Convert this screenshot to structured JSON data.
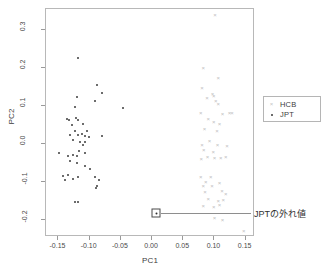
{
  "chart_data": {
    "type": "scatter",
    "title": "",
    "xlabel": "PC1",
    "ylabel": "PC2",
    "xlim": [
      -0.17,
      0.165
    ],
    "ylim": [
      -0.245,
      0.355
    ],
    "xticks": [
      -0.15,
      -0.1,
      -0.05,
      0.0,
      0.05,
      0.1,
      0.15
    ],
    "xticklabels": [
      "-0.15",
      "-0.10",
      "-0.05",
      "0.00",
      "0.05",
      "0.10",
      "0.15"
    ],
    "yticks": [
      -0.2,
      -0.1,
      0.0,
      0.1,
      0.2,
      0.3
    ],
    "yticklabels": [
      "-0.2",
      "-0.1",
      "0.0",
      "0.1",
      "0.2",
      "0.3"
    ],
    "grid": false,
    "legend_position": "right",
    "series": [
      {
        "name": "HCB",
        "marker": "x",
        "color": "#c0c0c0",
        "points": [
          [
            0.101,
            0.338
          ],
          [
            0.082,
            0.2
          ],
          [
            0.106,
            0.173
          ],
          [
            0.08,
            0.148
          ],
          [
            0.097,
            0.131
          ],
          [
            0.088,
            0.12
          ],
          [
            0.099,
            0.126
          ],
          [
            0.102,
            0.112
          ],
          [
            0.106,
            0.104
          ],
          [
            0.078,
            0.081
          ],
          [
            0.113,
            0.079
          ],
          [
            0.124,
            0.082
          ],
          [
            0.128,
            0.081
          ],
          [
            0.09,
            0.065
          ],
          [
            0.099,
            0.058
          ],
          [
            0.108,
            0.052
          ],
          [
            0.084,
            0.038
          ],
          [
            0.104,
            0.035
          ],
          [
            0.092,
            0.007
          ],
          [
            0.08,
            -0.002
          ],
          [
            0.105,
            -0.004
          ],
          [
            0.12,
            -0.005
          ],
          [
            0.083,
            -0.016
          ],
          [
            0.098,
            -0.021
          ],
          [
            0.089,
            -0.034
          ],
          [
            0.079,
            -0.04
          ],
          [
            0.1,
            -0.038
          ],
          [
            0.11,
            -0.037
          ],
          [
            0.118,
            -0.035
          ],
          [
            0.078,
            -0.086
          ],
          [
            0.094,
            -0.088
          ],
          [
            0.086,
            -0.099
          ],
          [
            0.108,
            -0.103
          ],
          [
            0.082,
            -0.112
          ],
          [
            0.096,
            -0.11
          ],
          [
            0.085,
            -0.127
          ],
          [
            0.112,
            -0.124
          ],
          [
            0.118,
            -0.131
          ],
          [
            0.09,
            -0.145
          ],
          [
            0.106,
            -0.149
          ],
          [
            0.114,
            -0.148
          ],
          [
            0.082,
            -0.163
          ],
          [
            0.099,
            -0.166
          ],
          [
            0.108,
            -0.161
          ],
          [
            0.1,
            -0.196
          ],
          [
            0.113,
            -0.199
          ],
          [
            0.147,
            -0.228
          ]
        ]
      },
      {
        "name": "JPT",
        "marker": "point",
        "color": "#3b3b3b",
        "points": [
          [
            -0.118,
            0.225
          ],
          [
            -0.088,
            0.155
          ],
          [
            -0.08,
            0.134
          ],
          [
            -0.12,
            0.123
          ],
          [
            -0.091,
            0.114
          ],
          [
            -0.124,
            0.097
          ],
          [
            -0.046,
            0.095
          ],
          [
            -0.137,
            0.065
          ],
          [
            -0.133,
            0.064
          ],
          [
            -0.122,
            0.067
          ],
          [
            -0.118,
            0.063
          ],
          [
            -0.129,
            0.05
          ],
          [
            -0.111,
            0.053
          ],
          [
            -0.124,
            0.035
          ],
          [
            -0.104,
            0.034
          ],
          [
            -0.131,
            0.023
          ],
          [
            -0.119,
            0.024
          ],
          [
            -0.112,
            0.027
          ],
          [
            -0.108,
            0.021
          ],
          [
            -0.081,
            0.022
          ],
          [
            -0.101,
            0.017
          ],
          [
            -0.126,
            0.009
          ],
          [
            -0.116,
            0.004
          ],
          [
            -0.107,
            0.006
          ],
          [
            -0.111,
            -0.002
          ],
          [
            -0.149,
            -0.023
          ],
          [
            -0.117,
            -0.019
          ],
          [
            -0.107,
            -0.023
          ],
          [
            -0.135,
            -0.033
          ],
          [
            -0.126,
            -0.03
          ],
          [
            -0.12,
            -0.032
          ],
          [
            -0.131,
            -0.044
          ],
          [
            -0.121,
            -0.051
          ],
          [
            -0.108,
            -0.059
          ],
          [
            -0.099,
            -0.067
          ],
          [
            -0.142,
            -0.085
          ],
          [
            -0.134,
            -0.082
          ],
          [
            -0.119,
            -0.086
          ],
          [
            -0.091,
            -0.086
          ],
          [
            -0.139,
            -0.096
          ],
          [
            -0.127,
            -0.093
          ],
          [
            -0.085,
            -0.095
          ],
          [
            -0.088,
            -0.11
          ],
          [
            -0.09,
            -0.116
          ],
          [
            -0.123,
            -0.152
          ],
          [
            -0.119,
            -0.154
          ]
        ]
      }
    ],
    "annotations": [
      {
        "name": "jpt-outlier",
        "text": "JPTの外れ値",
        "point": [
          0.008,
          -0.185
        ],
        "marker": "boxed-point"
      }
    ]
  },
  "axes": {
    "x_title": "PC1",
    "y_title": "PC2",
    "x_ticklabels": [
      "-0.15",
      "-0.10",
      "-0.05",
      "0.00",
      "0.05",
      "0.10",
      "0.15"
    ],
    "y_ticklabels": [
      "0.3",
      "0.2",
      "0.1",
      "0.0",
      "-0.1",
      "-0.2"
    ]
  },
  "legend": {
    "entries": [
      {
        "label": "HCB",
        "marker": "x-marker",
        "color": "#c0c0c0"
      },
      {
        "label": "JPT",
        "marker": "dot-marker",
        "color": "#3b3b3b"
      }
    ]
  },
  "annotation": {
    "outlier_label": "JPTの外れ値"
  }
}
